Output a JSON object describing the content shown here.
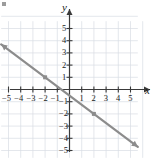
{
  "figure": {
    "corner_mark": "bullet-marker",
    "axis_labels": {
      "x": "x",
      "y": "y"
    }
  },
  "chart_data": {
    "type": "line",
    "title": "",
    "xlabel": "x",
    "ylabel": "y",
    "xlim": [
      -6,
      6
    ],
    "ylim": [
      -5.8,
      5.8
    ],
    "grid": true,
    "legend": "none",
    "xticks": [
      -5,
      -4,
      -3,
      -2,
      -1,
      1,
      2,
      3,
      4,
      5
    ],
    "yticks": [
      5,
      4,
      3,
      2,
      1,
      -1,
      -2,
      -3,
      -4,
      -5
    ],
    "xtick_labels": [
      "−5",
      "−4",
      "−3",
      "−2",
      "−1",
      "1",
      "2",
      "3",
      "4",
      "5"
    ],
    "ytick_labels": [
      "5",
      "4",
      "3",
      "2",
      "1",
      "−1",
      "−2",
      "−3",
      "−4",
      "−5"
    ],
    "series": [
      {
        "name": "line",
        "kind": "line",
        "slope": -0.75,
        "intercept": -0.5,
        "x": [
          -5.6,
          5.6
        ],
        "y": [
          3.7,
          -4.7
        ],
        "arrow_start": true,
        "arrow_end": true,
        "color": "#8c8c8c",
        "width": 2.2
      },
      {
        "name": "marked-points",
        "kind": "scatter",
        "points": [
          {
            "x": -2,
            "y": 1
          },
          {
            "x": 2,
            "y": -2
          }
        ],
        "color": "#8c8c8c",
        "marker": "square",
        "size": 4
      }
    ],
    "colors": {
      "line": "#8c8c8c",
      "grid": "#d9dde4",
      "axis": "#3a3a3a",
      "text": "#1a1a1a",
      "background": "#ffffff"
    }
  }
}
